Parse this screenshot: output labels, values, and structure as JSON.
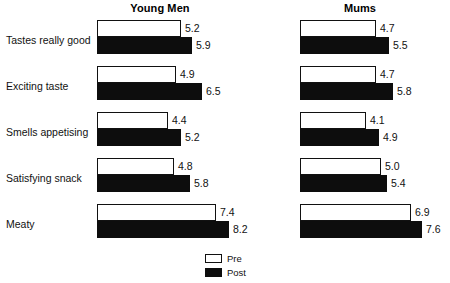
{
  "chart_data": {
    "type": "bar",
    "title": "",
    "orientation": "horizontal",
    "grid": false,
    "xlabel": "",
    "ylabel": "",
    "xlim": [
      0,
      8.2
    ],
    "categories": [
      "Tastes really good",
      "Exciting taste",
      "Smells appetising",
      "Satisfying snack",
      "Meaty"
    ],
    "panels": [
      {
        "name": "Young Men",
        "series": [
          {
            "name": "Pre",
            "values": [
              5.2,
              4.9,
              4.4,
              4.8,
              7.4
            ]
          },
          {
            "name": "Post",
            "values": [
              5.9,
              6.5,
              5.2,
              5.8,
              8.2
            ]
          }
        ]
      },
      {
        "name": "Mums",
        "series": [
          {
            "name": "Pre",
            "values": [
              4.7,
              4.7,
              4.1,
              5.0,
              6.9
            ]
          },
          {
            "name": "Post",
            "values": [
              5.5,
              5.8,
              4.9,
              5.4,
              7.6
            ]
          }
        ]
      }
    ],
    "legend": {
      "position": "bottom-center",
      "entries": [
        {
          "label": "Pre",
          "color": "#ffffff",
          "border": "#111111"
        },
        {
          "label": "Post",
          "color": "#0d0d0d",
          "border": "#0d0d0d"
        }
      ]
    },
    "value_labels": {
      "young_men": {
        "pre": [
          "5.2",
          "4.9",
          "4.4",
          "4.8",
          "7.4"
        ],
        "post": [
          "5.9",
          "6.5",
          "5.2",
          "5.8",
          "8.2"
        ]
      },
      "mums": {
        "pre": [
          "4.7",
          "4.7",
          "4.1",
          "5.0",
          "6.9"
        ],
        "post": [
          "5.5",
          "5.8",
          "4.9",
          "5.4",
          "7.6"
        ]
      }
    }
  },
  "panels": {
    "young_men": {
      "title": "Young Men"
    },
    "mums": {
      "title": "Mums"
    }
  },
  "categories": {
    "c0": "Tastes really good",
    "c1": "Exciting taste",
    "c2": "Smells appetising",
    "c3": "Satisfying snack",
    "c4": "Meaty"
  },
  "legend": {
    "pre": "Pre",
    "post": "Post"
  },
  "colors": {
    "pre_fill": "#ffffff",
    "post_fill": "#0d0d0d",
    "stroke": "#111111",
    "text": "#111111",
    "background": "#ffffff"
  }
}
